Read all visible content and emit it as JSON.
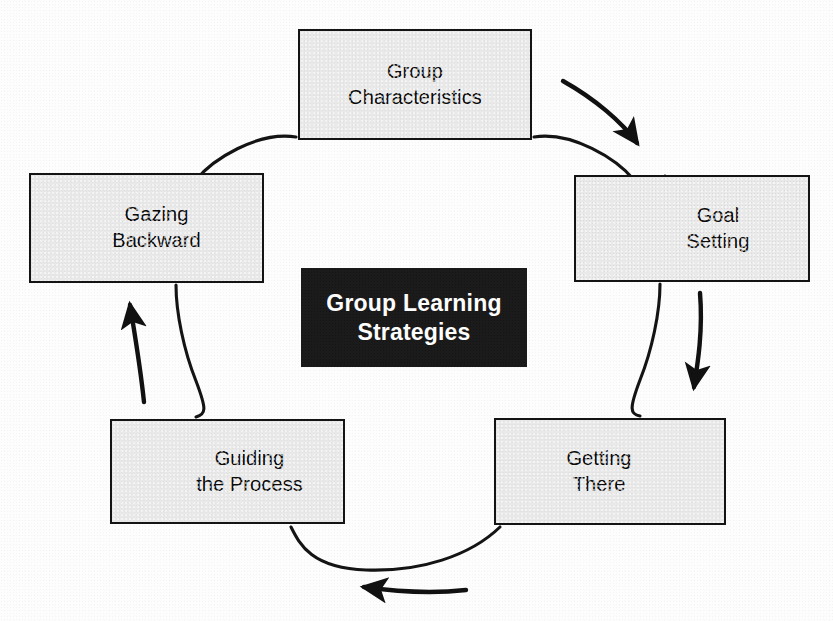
{
  "diagram": {
    "type": "cycle",
    "center": {
      "text": "Group Learning\nStrategies",
      "background_color": "#1b1b1b",
      "text_color": "#ffffff"
    },
    "node_fill_color": "#e9e9e9",
    "node_border_color": "#141414",
    "nodes": [
      {
        "id": "group-characteristics",
        "text": "Group\nCharacteristics",
        "position": "top"
      },
      {
        "id": "goal-setting",
        "text": "Goal\nSetting",
        "position": "right"
      },
      {
        "id": "getting-there",
        "text": "Getting\nThere",
        "position": "bottom-right"
      },
      {
        "id": "guiding-the-process",
        "text": "Guiding\nthe Process",
        "position": "bottom-left"
      },
      {
        "id": "gazing-backward",
        "text": "Gazing\nBackward",
        "position": "left"
      }
    ],
    "arrows": [
      {
        "id": "arrow-top-right",
        "direction": "down-right",
        "from": "group-characteristics",
        "to": "goal-setting"
      },
      {
        "id": "arrow-right",
        "direction": "down",
        "from": "goal-setting",
        "to": "getting-there"
      },
      {
        "id": "arrow-bottom",
        "direction": "left",
        "from": "getting-there",
        "to": "guiding-the-process"
      },
      {
        "id": "arrow-left",
        "direction": "up",
        "from": "guiding-the-process",
        "to": "gazing-backward"
      }
    ]
  }
}
